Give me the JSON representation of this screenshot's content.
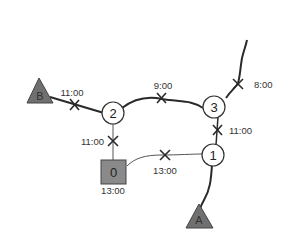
{
  "diagram": {
    "type": "network",
    "colors": {
      "edge": "#2a2a2a",
      "thin_edge": "#555555",
      "node_fill": "#ffffff",
      "node_stroke": "#333333",
      "terminal_fill": "#707070",
      "depot_fill": "#8a8a8a",
      "text": "#333333"
    },
    "nodes": [
      {
        "id": "n1",
        "label": "1",
        "shape": "circle"
      },
      {
        "id": "n2",
        "label": "2",
        "shape": "circle"
      },
      {
        "id": "n3",
        "label": "3",
        "shape": "circle"
      },
      {
        "id": "n0",
        "label": "0",
        "shape": "square",
        "time": "13:00"
      }
    ],
    "terminals": [
      {
        "id": "A",
        "label": "A",
        "shape": "triangle"
      },
      {
        "id": "B",
        "label": "B",
        "shape": "triangle"
      }
    ],
    "edges": [
      {
        "from": "B",
        "to": "2",
        "time": "11:00"
      },
      {
        "from": "2",
        "to": "3",
        "time": "9:00"
      },
      {
        "from": "3",
        "to": "top",
        "time": "8:00"
      },
      {
        "from": "3",
        "to": "1",
        "time": "11:00"
      },
      {
        "from": "2",
        "to": "0",
        "time": "11:00"
      },
      {
        "from": "0",
        "to": "1",
        "time": "13:00"
      },
      {
        "from": "1",
        "to": "A",
        "time": ""
      }
    ]
  }
}
